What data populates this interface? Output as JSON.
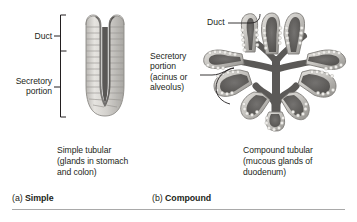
{
  "figure": {
    "background_color": "#ffffff",
    "text_color": "#231f20",
    "divider_color": "#a9a9a9"
  },
  "panel_a": {
    "tag_letter": "(a)",
    "tag_name": "Simple",
    "bracket_labels": {
      "duct": "Duct",
      "secretory_portion": "Secretory\nportion"
    },
    "caption": "Simple tubular\n(glands in stomach\nand colon)",
    "illustration": {
      "name": "simple-tubular-gland",
      "description": "U-shaped tubular gland with cuboidal cell lining and dark central lumen",
      "lumen_color": "#6f6f6f",
      "cell_color": "#d8d6d2",
      "outline_color": "#8c8a86"
    }
  },
  "panel_b": {
    "tag_letter": "(b)",
    "tag_name": "Compound",
    "labels": {
      "duct": "Duct",
      "secretory_portion": "Secretory\nportion\n(acinus or\nalveolus)"
    },
    "caption": "Compound tubular\n(mucous glands of\nduodenum)",
    "illustration": {
      "name": "compound-tubular-gland",
      "description": "Branched tree-like gland with multiple secretory lobes converging on a central duct",
      "lumen_color": "#6a6a6a",
      "cell_color": "#cfcdc9",
      "outline_color": "#7e7c78"
    }
  }
}
